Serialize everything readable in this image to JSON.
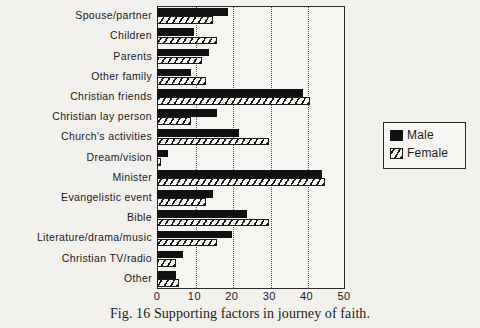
{
  "caption": "Fig. 16 Supporting factors in journey of faith.",
  "legend": {
    "title": "",
    "entries": [
      {
        "label": "Male",
        "key": "male",
        "swatch": "solid-black-swatch"
      },
      {
        "label": "Female",
        "key": "female",
        "swatch": "hatched-swatch"
      }
    ]
  },
  "axis": {
    "xlabel": "",
    "ticks": [
      "0",
      "10",
      "20",
      "30",
      "40",
      "50"
    ]
  },
  "chart_data": {
    "type": "bar",
    "orientation": "horizontal",
    "title": "Fig. 16 Supporting factors in journey of faith.",
    "xlabel": "",
    "ylabel": "",
    "xlim": [
      0,
      50
    ],
    "xticks": [
      0,
      10,
      20,
      30,
      40,
      50
    ],
    "grid": "vertical-dotted",
    "legend_position": "right",
    "categories": [
      "Spouse/partner",
      "Children",
      "Parents",
      "Other  family",
      "Christian  friends",
      "Christian  lay  person",
      "Church's  activities",
      "Dream/vision",
      "Minister",
      "Evangelistic  event",
      "Bible",
      "Literature/drama/music",
      "Christian  TV/radio",
      "Other"
    ],
    "series": [
      {
        "name": "Male",
        "color": "#111111",
        "values": [
          19,
          10,
          14,
          9,
          39,
          16,
          22,
          3,
          44,
          15,
          24,
          20,
          7,
          5
        ]
      },
      {
        "name": "Female",
        "color": "#ffffff",
        "pattern": "diagonal-hatch",
        "values": [
          15,
          16,
          12,
          13,
          41,
          9,
          30,
          1,
          45,
          13,
          30,
          16,
          5,
          6
        ]
      }
    ]
  }
}
